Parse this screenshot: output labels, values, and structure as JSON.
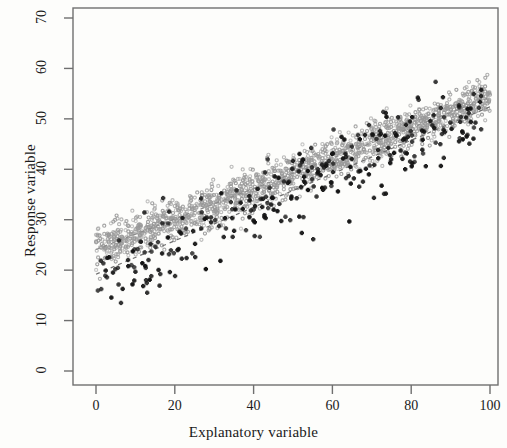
{
  "chart_data": {
    "type": "scatter",
    "title": "",
    "xlabel": "Explanatory variable",
    "ylabel": "Response variable",
    "xlim": [
      0,
      100
    ],
    "ylim": [
      0,
      70
    ],
    "xticks": [
      "0",
      "20",
      "40",
      "60",
      "80",
      "100"
    ],
    "yticks": [
      "0",
      "10",
      "20",
      "30",
      "40",
      "50",
      "60",
      "70"
    ],
    "grid": false,
    "legend": "none",
    "frame": "box",
    "tick_label_rotation": -90,
    "series": [
      {
        "name": "gray-dense-cloud",
        "marker": "open-circle",
        "color": "#9a9a9a",
        "marker_size": 3.1,
        "n": 1500,
        "fit_slope": 0.302,
        "fit_intercept": 24.1,
        "noise_sd": 2.0,
        "x_range": [
          0,
          100
        ],
        "description": "Dense tight band of small gray open circles rising from about 24 at x=0 to about 54 at x=100"
      },
      {
        "name": "black-cross-scatter",
        "marker": "plus-cross",
        "color": "#141414",
        "marker_size": 4.4,
        "n": 300,
        "fit_slope": 0.332,
        "fit_intercept": 19.2,
        "noise_sd": 4.0,
        "x_range": [
          0,
          100
        ],
        "description": "Sparser darker plus-shaped markers with wider vertical spread, from about 19 at x=0 to about 52 at x=100"
      }
    ],
    "trend_lines": [
      {
        "name": "gray-series-fit",
        "style": "dashed",
        "color": "#8c8c8c",
        "slope": 0.302,
        "intercept": 24.1
      },
      {
        "name": "black-series-fit",
        "style": "dashed",
        "color": "#6e6e6e",
        "slope": 0.332,
        "intercept": 19.2
      }
    ],
    "observed_extremes": {
      "y_max_approx": 61,
      "y_min_approx": 13,
      "x_at_y_max": 97
    }
  },
  "colors": {
    "frame": "#6f6f6f",
    "background": "#fdfdfb",
    "text": "#1a1a1a",
    "gray_points": "#9a9a9a",
    "dark_points": "#141414"
  }
}
